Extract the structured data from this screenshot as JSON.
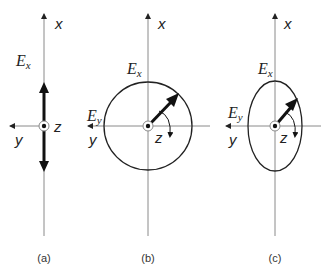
{
  "figure": {
    "panels": [
      {
        "id": "a",
        "caption": "(a)",
        "type": "linear",
        "axis_x_label": "x",
        "axis_y_label": "y",
        "axis_z_label": "z",
        "field_label_x": "E",
        "field_label_x_sub": "x"
      },
      {
        "id": "b",
        "caption": "(b)",
        "type": "circular",
        "axis_x_label": "x",
        "axis_y_label": "y",
        "axis_z_label": "z",
        "field_label_x": "E",
        "field_label_x_sub": "x",
        "field_label_y": "E",
        "field_label_y_sub": "y"
      },
      {
        "id": "c",
        "caption": "(c)",
        "type": "elliptical",
        "axis_x_label": "x",
        "axis_y_label": "y",
        "axis_z_label": "z",
        "field_label_x": "E",
        "field_label_x_sub": "x",
        "field_label_y": "E",
        "field_label_y_sub": "y"
      }
    ],
    "colors": {
      "axis": "#8a8a8a",
      "shape": "#222222",
      "vector": "#111111"
    }
  }
}
